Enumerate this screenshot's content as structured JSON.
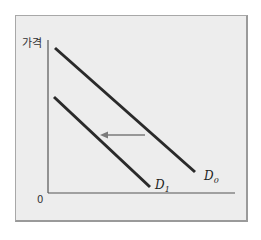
{
  "diagram": {
    "type": "demand-curve-shift",
    "y_axis_label": "가격",
    "origin_label": "0",
    "curves": [
      {
        "name": "D0",
        "label_main": "D",
        "label_sub": "0",
        "start": [
          55,
          48
        ],
        "end": [
          195,
          172
        ]
      },
      {
        "name": "D1",
        "label_main": "D",
        "label_sub": "1",
        "start": [
          54,
          97
        ],
        "end": [
          150,
          187
        ]
      }
    ],
    "shift_arrow": {
      "direction": "left",
      "from": [
        145,
        135
      ],
      "to": [
        100,
        135
      ]
    },
    "colors": {
      "background": "#ededed",
      "curve": "#2a2a2a",
      "axis": "#555555",
      "arrow": "#7a7a7a"
    }
  }
}
